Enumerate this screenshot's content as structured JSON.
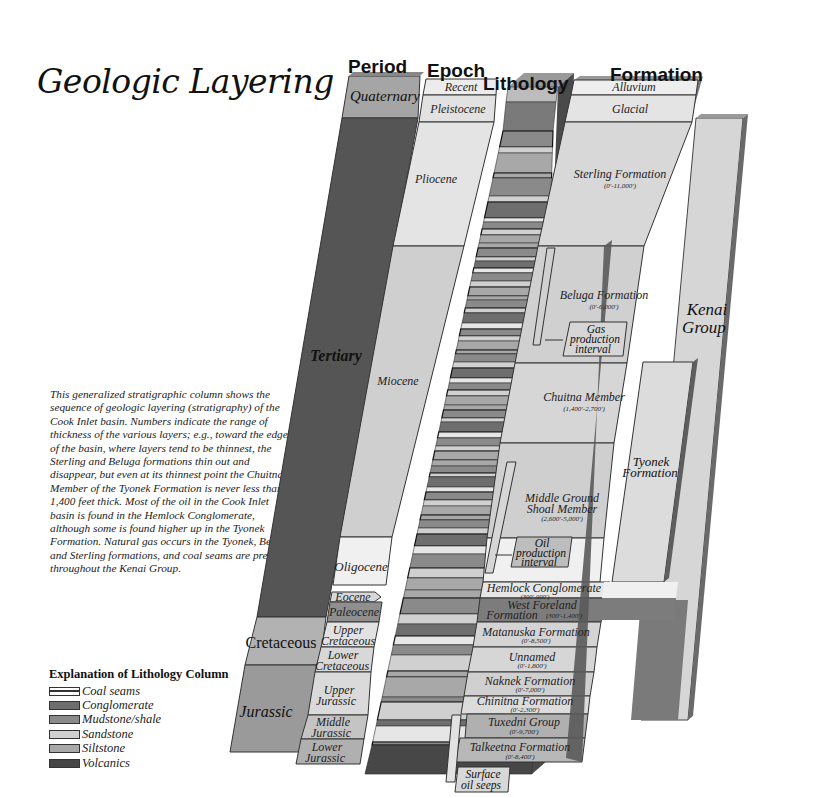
{
  "title": "Geologic Layering",
  "description": "This generalized stratigraphic column shows the sequence of geologic layering (stratigraphy) of the Cook Inlet basin. Numbers indicate the range of thickness of the various layers; e.g., toward the edges of the basin, where layers tend to be thinnest, the Sterling and Beluga formations thin out and disappear, but even at its thinnest point the Chuitna Member of the Tyonek Formation is never less than 1,400 feet thick. Most of the oil in the Cook Inlet basin is found in the Hemlock Conglomerate, although some is found higher up in the Tyonek Formation. Natural gas occurs in the Tyonek, Beluga, and Sterling formations, and coal seams are present throughout the Kenai Group.",
  "headers": {
    "period": "Period",
    "epoch": "Epoch",
    "lithology": "Lithology",
    "formation": "Formation"
  },
  "periods": [
    {
      "name": "Quaternary"
    },
    {
      "name": "Tertiary"
    },
    {
      "name": "Cretaceous"
    },
    {
      "name": "Jurassic"
    }
  ],
  "epochs": [
    {
      "name": "Recent"
    },
    {
      "name": "Pleistocene"
    },
    {
      "name": "Pliocene"
    },
    {
      "name": "Miocene"
    },
    {
      "name": "Oligocene"
    },
    {
      "name": "Eocene"
    },
    {
      "name": "Paleocene"
    },
    {
      "name": "Upper Cretaceous",
      "line1": "Upper",
      "line2": "Cretaceous"
    },
    {
      "name": "Lower Cretaceous",
      "line1": "Lower",
      "line2": "Cretaceous"
    },
    {
      "name": "Upper Jurassic",
      "line1": "Upper",
      "line2": "Jurassic"
    },
    {
      "name": "Middle Jurassic",
      "line1": "Middle",
      "line2": "Jurassic"
    },
    {
      "name": "Lower Jurassic",
      "line1": "Lower",
      "line2": "Jurassic"
    }
  ],
  "formations": [
    {
      "name": "Alluvium",
      "range": ""
    },
    {
      "name": "Glacial",
      "range": ""
    },
    {
      "name": "Sterling Formation",
      "range": "(0'-11,000')"
    },
    {
      "name": "Beluga Formation",
      "range": "(0'-6,000')"
    },
    {
      "name": "Chuitna Member",
      "range": "(1,400'-2,700')"
    },
    {
      "name": "Middle Ground Shoal Member",
      "line1": "Middle Ground",
      "line2": "Shoal Member",
      "range": "(2,600'-5,000')"
    },
    {
      "name": "Hemlock Conglomerate",
      "range": "(300'-900')"
    },
    {
      "name": "West Foreland Formation",
      "line1": "West Foreland",
      "line2": "Formation",
      "range": "(300'-1,400')"
    },
    {
      "name": "Matanuska Formation",
      "range": "(0'-8,500')"
    },
    {
      "name": "Unnamed",
      "range": "(0'-1,800')"
    },
    {
      "name": "Naknek Formation",
      "range": "(0'-7,000')"
    },
    {
      "name": "Chinitna Formation",
      "range": "(0'-2,300')"
    },
    {
      "name": "Tuxedni Group",
      "range": "(0'-9,700')"
    },
    {
      "name": "Talkeetna Formation",
      "range": "(0'-8,400')"
    }
  ],
  "groups": {
    "kenai": {
      "line1": "Kenai",
      "line2": "Group"
    },
    "tyonek": {
      "line1": "Tyonek",
      "line2": "Formation"
    }
  },
  "callouts": {
    "gas": {
      "line1": "Gas",
      "line2": "production",
      "line3": "interval"
    },
    "oil": {
      "line1": "Oil",
      "line2": "production",
      "line3": "interval"
    },
    "seeps": {
      "line1": "Surface",
      "line2": "oil seeps"
    }
  },
  "legend": {
    "title": "Explanation of Lithology Column",
    "items": [
      {
        "label": "Coal seams",
        "color": "#f2f2f2"
      },
      {
        "label": "Conglomerate",
        "color": "#6e6e6e"
      },
      {
        "label": "Mudstone/shale",
        "color": "#8a8a8a"
      },
      {
        "label": "Sandstone",
        "color": "#d0d0d0"
      },
      {
        "label": "Siltstone",
        "color": "#a8a8a8"
      },
      {
        "label": "Volcanics",
        "color": "#454545"
      }
    ]
  },
  "colors": {
    "tertiary": "#555555",
    "quaternary": "#a5a5a5",
    "cretaceous": "#b2b2b2",
    "jurassic": "#9a9a9a",
    "light": "#dcdcdc",
    "lighter": "#ececec",
    "edge": "#555555"
  }
}
